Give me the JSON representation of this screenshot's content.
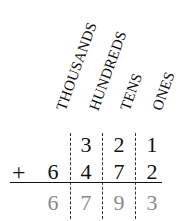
{
  "place_value_labels": [
    "THOUSANDS",
    "HUNDREDS",
    "TENS",
    "ONES"
  ],
  "addend_1": {
    "digits": [
      "",
      "3",
      "2",
      "1"
    ]
  },
  "addend_2": {
    "operator": "+",
    "digits": [
      "6",
      "4",
      "7",
      "2"
    ]
  },
  "sum": {
    "digits": [
      "6",
      "7",
      "9",
      "3"
    ]
  },
  "colors": {
    "text": "#111111",
    "result": "#8a8a8a"
  }
}
